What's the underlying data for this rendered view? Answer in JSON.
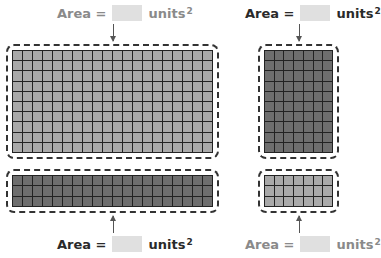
{
  "figures": [
    {
      "id": "top-left",
      "label": {
        "prefix": "Area =",
        "suffix": "units",
        "exponent": "2",
        "answer": ""
      },
      "label_position": "above",
      "grid": {
        "columns": 20,
        "rows": 10,
        "fill": "#a9a9a9"
      }
    },
    {
      "id": "top-right",
      "label": {
        "prefix": "Area =",
        "suffix": "units",
        "exponent": "2",
        "answer": ""
      },
      "label_position": "above",
      "grid": {
        "columns": 7,
        "rows": 10,
        "fill": "#6e6e6e"
      }
    },
    {
      "id": "bottom-left",
      "label": {
        "prefix": "Area =",
        "suffix": "units",
        "exponent": "2",
        "answer": ""
      },
      "label_position": "below",
      "grid": {
        "columns": 20,
        "rows": 3,
        "fill": "#6e6e6e"
      }
    },
    {
      "id": "bottom-right",
      "label": {
        "prefix": "Area =",
        "suffix": "units",
        "exponent": "2",
        "answer": ""
      },
      "label_position": "below",
      "grid": {
        "columns": 7,
        "rows": 3,
        "fill": "#a9a9a9"
      }
    }
  ],
  "colors": {
    "answer_box": "#e0e0e0",
    "grid_line": "#222222",
    "frame": "#333333"
  }
}
